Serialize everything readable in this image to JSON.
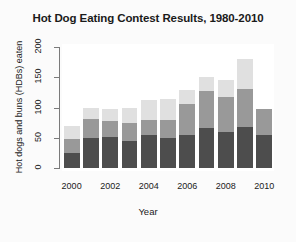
{
  "chart_data": {
    "type": "bar",
    "subtype": "stacked-bar",
    "title": "Hot Dog Eating Contest Results, 1980-2010",
    "xlabel": "Year",
    "ylabel": "Hot dogs and buns (HDBs) eaten",
    "categories": [
      "2000",
      "2001",
      "2002",
      "2003",
      "2004",
      "2005",
      "2006",
      "2007",
      "2008",
      "2009",
      "2010"
    ],
    "xtick_labels": [
      "2000",
      "2002",
      "2004",
      "2006",
      "2008",
      "2010"
    ],
    "xtick_categories": [
      "2000",
      "2002",
      "2004",
      "2006",
      "2008",
      "2010"
    ],
    "ylim": [
      0,
      210
    ],
    "ytick_values": [
      0,
      50,
      100,
      150,
      200
    ],
    "ytick_labels": [
      "0",
      "50",
      "100",
      "150",
      "200"
    ],
    "grid": false,
    "legend": "none",
    "series": [
      {
        "name": "first place",
        "color": "#4d4d4d",
        "values": [
          25,
          50,
          51,
          45,
          54,
          49,
          54,
          66,
          59,
          68,
          54
        ]
      },
      {
        "name": "second place",
        "color": "#999999",
        "values": [
          23,
          31,
          26,
          30,
          25,
          31,
          51,
          62,
          58,
          63,
          44
        ]
      },
      {
        "name": "third place",
        "color": "#e0e0e0",
        "values": [
          22,
          19,
          21,
          25,
          33,
          34,
          24,
          22,
          28,
          49,
          0
        ]
      }
    ],
    "totals": [
      70,
      100,
      98,
      100,
      112,
      114,
      129,
      150,
      145,
      180,
      98
    ]
  }
}
